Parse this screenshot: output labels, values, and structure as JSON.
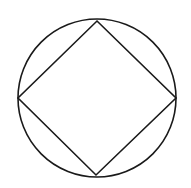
{
  "diagram": {
    "stroke_color": "#1a1a1a",
    "background": "#ffffff",
    "stroke_width": 1.6,
    "circle": {
      "cx": 97,
      "cy": 98,
      "r": 79
    },
    "square": {
      "vertices": [
        {
          "name": "top",
          "x": 97,
          "y": 21
        },
        {
          "name": "right",
          "x": 176,
          "y": 98
        },
        {
          "name": "bottom",
          "x": 96,
          "y": 175
        },
        {
          "name": "left",
          "x": 18,
          "y": 98
        }
      ]
    }
  }
}
